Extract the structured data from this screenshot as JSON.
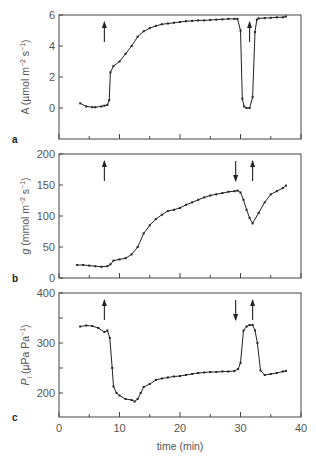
{
  "chart_data": [
    {
      "type": "line",
      "panel_label": "a",
      "title": "",
      "xlabel": "",
      "ylabel": "A (µmol m⁻² s⁻¹)",
      "ylabel_parts": {
        "main": "A (µmol m",
        "sup1": "−2",
        "mid": " s",
        "sup2": "−1",
        "end": ")"
      },
      "xlim": [
        0,
        40
      ],
      "ylim": [
        -2,
        6
      ],
      "yticks": [
        0,
        2,
        4,
        6
      ],
      "xticks": [
        0,
        5,
        10,
        15,
        20,
        25,
        30,
        35,
        40
      ],
      "grid": false,
      "arrows": [
        {
          "t": 7.5,
          "direction": "up"
        },
        {
          "t": 31.5,
          "direction": "up"
        }
      ],
      "x": [
        3.5,
        4.5,
        5.5,
        6.0,
        7.0,
        7.5,
        8.0,
        8.3,
        8.5,
        9.0,
        10.0,
        11.0,
        12.0,
        13.0,
        14.0,
        15.0,
        16.0,
        17.0,
        18.0,
        19.0,
        20.0,
        21.0,
        22.0,
        23.0,
        24.0,
        25.0,
        26.0,
        27.0,
        28.0,
        29.0,
        29.5,
        30.0,
        30.3,
        30.6,
        31.0,
        31.5,
        32.0,
        32.4,
        32.7,
        33.0,
        34.0,
        35.0,
        36.0,
        37.0,
        37.5
      ],
      "values": [
        0.3,
        0.1,
        0.05,
        0.05,
        0.1,
        0.15,
        0.2,
        0.5,
        2.3,
        2.7,
        3.0,
        3.5,
        4.0,
        4.6,
        4.95,
        5.15,
        5.3,
        5.4,
        5.45,
        5.5,
        5.55,
        5.6,
        5.62,
        5.65,
        5.65,
        5.68,
        5.7,
        5.72,
        5.75,
        5.75,
        5.75,
        5.0,
        0.6,
        0.1,
        0.0,
        0.0,
        0.7,
        4.9,
        5.7,
        5.78,
        5.8,
        5.82,
        5.85,
        5.85,
        5.9
      ]
    },
    {
      "type": "line",
      "panel_label": "b",
      "title": "",
      "xlabel": "",
      "ylabel": "g (mmol m⁻² s⁻¹)",
      "ylabel_parts": {
        "main": "g (mmol m",
        "sup1": "−2",
        "mid": " s",
        "sup2": "−1",
        "end": ")"
      },
      "xlim": [
        0,
        40
      ],
      "ylim": [
        0,
        200
      ],
      "yticks": [
        0,
        50,
        100,
        150,
        200
      ],
      "xticks": [
        0,
        5,
        10,
        15,
        20,
        25,
        30,
        35,
        40
      ],
      "grid": false,
      "arrows": [
        {
          "t": 7.5,
          "direction": "up"
        },
        {
          "t": 29.2,
          "direction": "down"
        },
        {
          "t": 32.0,
          "direction": "up"
        }
      ],
      "x": [
        3.0,
        4.0,
        5.0,
        6.0,
        7.0,
        8.0,
        8.5,
        9.0,
        10.0,
        11.0,
        12.0,
        13.0,
        14.0,
        15.0,
        16.0,
        17.0,
        18.0,
        19.0,
        20.0,
        21.0,
        22.0,
        23.0,
        24.0,
        25.0,
        26.0,
        27.0,
        28.0,
        29.0,
        29.5,
        30.0,
        30.5,
        31.0,
        31.5,
        32.0,
        33.0,
        34.0,
        35.0,
        36.0,
        37.0,
        37.5
      ],
      "values": [
        21,
        21,
        20,
        19,
        18,
        19,
        22,
        28,
        30,
        32,
        38,
        50,
        72,
        85,
        95,
        102,
        108,
        110,
        113,
        118,
        122,
        126,
        130,
        133,
        135,
        137,
        139,
        140,
        141,
        138,
        126,
        110,
        97,
        88,
        105,
        122,
        135,
        140,
        145,
        149
      ]
    },
    {
      "type": "line",
      "panel_label": "c",
      "title": "",
      "xlabel": "time (min)",
      "ylabel": "Pᵢ (µPa Pa⁻¹)",
      "ylabel_parts": {
        "main": "P",
        "sub": "i",
        "rest": " (µPa Pa",
        "sup": "−1",
        "end": ")"
      },
      "xlim": [
        0,
        40
      ],
      "ylim": [
        152,
        400
      ],
      "yticks": [
        200,
        250,
        300,
        350,
        400
      ],
      "ytick_labels": [
        "200",
        "",
        "300",
        "",
        "400"
      ],
      "xticks": [
        0,
        5,
        10,
        15,
        20,
        25,
        30,
        35,
        40
      ],
      "xtick_labels": [
        "0",
        "",
        "10",
        "",
        "20",
        "",
        "30",
        "",
        "40"
      ],
      "grid": false,
      "arrows": [
        {
          "t": 7.5,
          "direction": "up"
        },
        {
          "t": 29.2,
          "direction": "down"
        },
        {
          "t": 32.0,
          "direction": "up"
        }
      ],
      "x": [
        3.5,
        4.5,
        5.5,
        6.5,
        7.5,
        8.0,
        8.4,
        8.8,
        9.0,
        9.5,
        10.0,
        11.0,
        12.0,
        12.5,
        13.0,
        13.5,
        14.0,
        15.0,
        16.0,
        17.0,
        18.0,
        19.0,
        20.0,
        21.0,
        22.0,
        23.0,
        24.0,
        25.0,
        26.0,
        27.0,
        28.0,
        29.0,
        29.6,
        30.0,
        30.5,
        31.0,
        31.5,
        32.0,
        32.4,
        32.8,
        33.3,
        34.0,
        35.0,
        36.0,
        37.0,
        37.5
      ],
      "values": [
        333,
        335,
        334,
        330,
        322,
        325,
        310,
        250,
        213,
        200,
        195,
        188,
        186,
        183,
        188,
        200,
        212,
        218,
        226,
        229,
        231,
        233,
        234,
        236,
        238,
        240,
        241,
        242,
        242,
        243,
        243,
        244,
        248,
        260,
        325,
        333,
        336,
        336,
        325,
        300,
        245,
        236,
        238,
        240,
        243,
        244
      ]
    }
  ]
}
